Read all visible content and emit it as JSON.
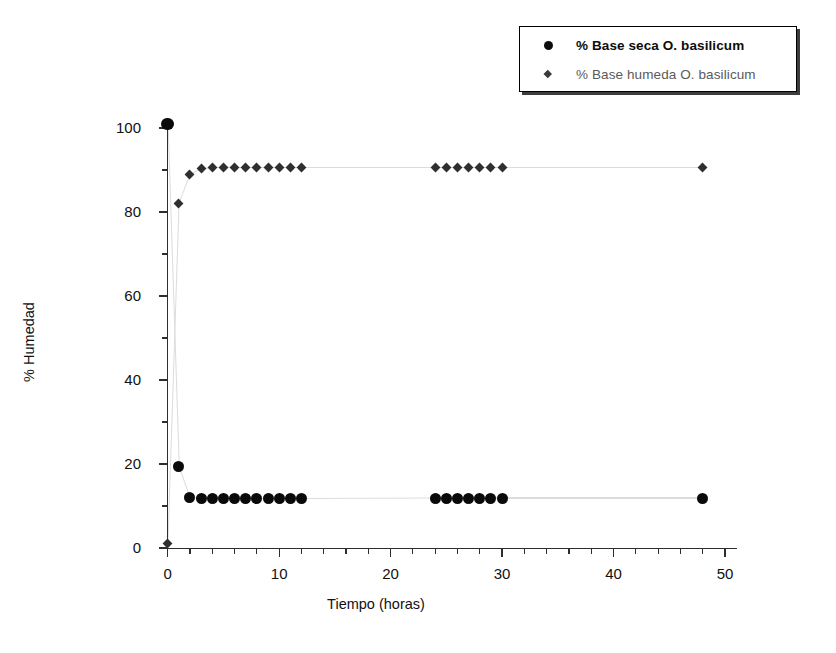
{
  "chart_data": {
    "type": "scatter",
    "title": "",
    "xlabel": "Tiempo (horas)",
    "ylabel": "% Humedad",
    "xlim": [
      0,
      50
    ],
    "ylim": [
      0,
      100
    ],
    "xticks": [
      0,
      10,
      20,
      30,
      40,
      50
    ],
    "yticks": [
      0,
      20,
      40,
      60,
      80,
      100
    ],
    "xtick_labels": [
      "0",
      "10",
      "20",
      "30",
      "40",
      "50"
    ],
    "ytick_labels": [
      "0",
      "20",
      "40",
      "60",
      "80",
      "100"
    ],
    "x_minor_tick_step": 2,
    "y_minor_tick_step": 10,
    "grid": false,
    "legend_position": "top-right",
    "series": [
      {
        "name": "% Base seca O. basilicum",
        "marker": "circle",
        "color": "#0a0a0a",
        "x": [
          0,
          1,
          2,
          3,
          4,
          5,
          6,
          7,
          8,
          9,
          10,
          11,
          12,
          24,
          25,
          26,
          27,
          28,
          29,
          30,
          48
        ],
        "y": [
          101,
          19.5,
          12,
          11.9,
          11.9,
          11.8,
          11.8,
          11.8,
          11.8,
          11.8,
          11.8,
          11.8,
          11.8,
          11.9,
          11.9,
          11.9,
          11.9,
          11.9,
          11.9,
          11.9,
          11.9
        ]
      },
      {
        "name": "% Base humeda O. basilicum",
        "marker": "diamond",
        "color": "#2f2f2f",
        "x": [
          0,
          1,
          2,
          3,
          4,
          5,
          6,
          7,
          8,
          9,
          10,
          11,
          12,
          24,
          25,
          26,
          27,
          28,
          29,
          30,
          48
        ],
        "y": [
          1,
          82,
          89,
          90.3,
          90.5,
          90.5,
          90.6,
          90.6,
          90.6,
          90.6,
          90.6,
          90.6,
          90.6,
          90.6,
          90.6,
          90.6,
          90.6,
          90.6,
          90.6,
          90.6,
          90.6
        ]
      }
    ]
  },
  "legend": {
    "entries": [
      {
        "label": "% Base seca O. basilicum",
        "marker": "circle-marker"
      },
      {
        "label": "% Base humeda O. basilicum",
        "marker": "diamond-marker"
      }
    ]
  },
  "axes": {
    "x_title": "Tiempo (horas)",
    "y_title": "% Humedad"
  }
}
